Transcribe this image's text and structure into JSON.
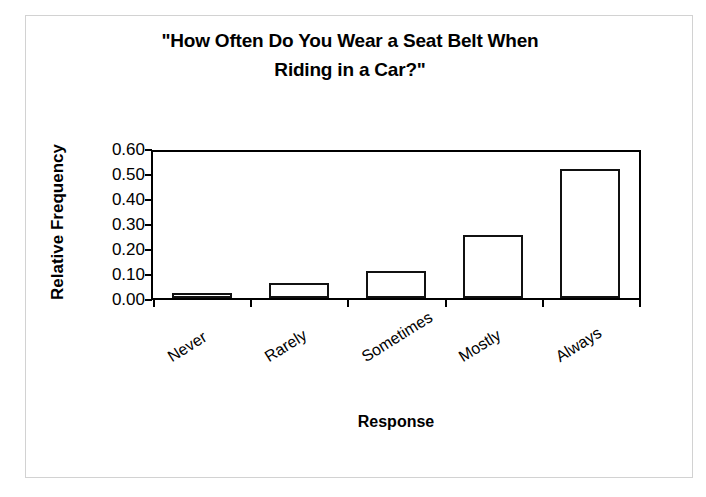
{
  "chart_data": {
    "type": "bar",
    "title": "\"How Often Do You Wear a Seat Belt When Riding in a Car?\"",
    "title_line1": "\"How Often Do You Wear a Seat Belt When",
    "title_line2": "Riding in a Car?\"",
    "xlabel": "Response",
    "ylabel": "Relative Frequency",
    "categories": [
      "Never",
      "Rarely",
      "Sometimes",
      "Mostly",
      "Always"
    ],
    "values": [
      0.02,
      0.06,
      0.11,
      0.26,
      0.53
    ],
    "ylim": [
      0.0,
      0.6
    ],
    "ytick_labels": [
      "0.60",
      "0.50",
      "0.40",
      "0.30",
      "0.20",
      "0.10",
      "0.00"
    ],
    "ytick_values": [
      0.6,
      0.5,
      0.4,
      0.3,
      0.2,
      0.1,
      0.0
    ],
    "grid": false,
    "legend": false,
    "bar_fill_color": "#ffffff",
    "bar_edge_color": "#111111",
    "axis_color": "#000000",
    "background_color": "#ffffff",
    "frame_color": "#d2d2d2"
  }
}
